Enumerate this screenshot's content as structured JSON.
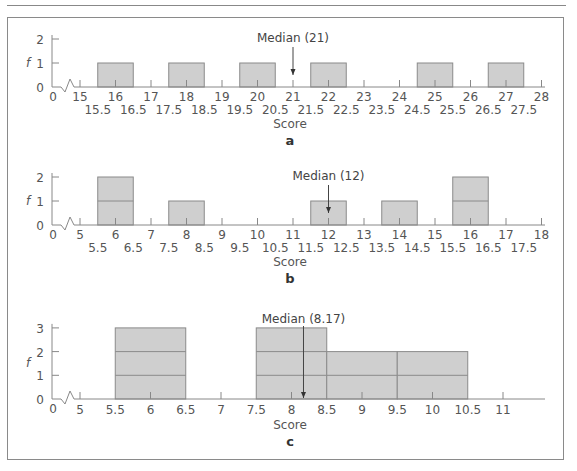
{
  "chart_data": [
    {
      "id": "a",
      "type": "bar",
      "title": "a",
      "xlabel": "Score",
      "ylabel": "f",
      "ylim": [
        0,
        2
      ],
      "yticks": [
        0,
        1,
        2
      ],
      "x_axis": {
        "origin_label": "0",
        "start": 15,
        "end": 28,
        "unit_px": 35.5,
        "origin_px": 80,
        "baseline_px": 87,
        "unit_y_px": 24
      },
      "major_ticks": [
        "15",
        "16",
        "17",
        "18",
        "19",
        "20",
        "21",
        "22",
        "23",
        "24",
        "25",
        "26",
        "27",
        "28"
      ],
      "boundary_ticks": [
        "15.5",
        "16.5",
        "17.5",
        "18.5",
        "19.5",
        "20.5",
        "21.5",
        "22.5",
        "23.5",
        "24.5",
        "25.5",
        "26.5",
        "27.5"
      ],
      "bars": [
        {
          "from": 15.5,
          "to": 16.5,
          "value": 1,
          "center": 16
        },
        {
          "from": 17.5,
          "to": 18.5,
          "value": 1,
          "center": 18
        },
        {
          "from": 19.5,
          "to": 20.5,
          "value": 1,
          "center": 20
        },
        {
          "from": 21.5,
          "to": 22.5,
          "value": 1,
          "center": 22
        },
        {
          "from": 24.5,
          "to": 25.5,
          "value": 1,
          "center": 25
        },
        {
          "from": 26.5,
          "to": 27.5,
          "value": 1,
          "center": 27
        }
      ],
      "median": {
        "label": "Median (21)",
        "value": 21
      }
    },
    {
      "id": "b",
      "type": "bar",
      "title": "b",
      "xlabel": "Score",
      "ylabel": "f",
      "ylim": [
        0,
        2
      ],
      "yticks": [
        0,
        1,
        2
      ],
      "x_axis": {
        "origin_label": "0",
        "start": 5,
        "end": 18,
        "unit_px": 35.5,
        "origin_px": 80,
        "baseline_px": 225,
        "unit_y_px": 24
      },
      "major_ticks": [
        "5",
        "6",
        "7",
        "8",
        "9",
        "10",
        "11",
        "12",
        "13",
        "14",
        "15",
        "16",
        "17",
        "18"
      ],
      "boundary_ticks": [
        "5.5",
        "6.5",
        "7.5",
        "8.5",
        "9.5",
        "10.5",
        "11.5",
        "12.5",
        "13.5",
        "14.5",
        "15.5",
        "16.5",
        "17.5"
      ],
      "bars": [
        {
          "from": 5.5,
          "to": 6.5,
          "value": 2,
          "center": 6
        },
        {
          "from": 7.5,
          "to": 8.5,
          "value": 1,
          "center": 8
        },
        {
          "from": 11.5,
          "to": 12.5,
          "value": 1,
          "center": 12
        },
        {
          "from": 13.5,
          "to": 14.5,
          "value": 1,
          "center": 14
        },
        {
          "from": 15.5,
          "to": 16.5,
          "value": 2,
          "center": 16
        }
      ],
      "median": {
        "label": "Median (12)",
        "value": 12
      }
    },
    {
      "id": "c",
      "type": "bar",
      "title": "c",
      "xlabel": "Score",
      "ylabel": "f",
      "ylim": [
        0,
        3
      ],
      "yticks": [
        0,
        1,
        2,
        3
      ],
      "x_axis": {
        "origin_label": "0",
        "start": 5,
        "end": 11,
        "unit_px": 70.5,
        "origin_px": 80,
        "baseline_px": 399,
        "unit_y_px": 23.7
      },
      "tick_labels": [
        "5",
        "5.5",
        "6",
        "6.5",
        "7",
        "7.5",
        "8",
        "8.5",
        "9",
        "9.5",
        "10",
        "10.5",
        "11"
      ],
      "bars": [
        {
          "from": 5.5,
          "to": 6.5,
          "value": 3,
          "center": 6
        },
        {
          "from": 7.5,
          "to": 8.5,
          "value": 3,
          "center": 8
        },
        {
          "from": 8.5,
          "to": 9.5,
          "value": 2,
          "center": 9
        },
        {
          "from": 9.5,
          "to": 10.5,
          "value": 2,
          "center": 10
        }
      ],
      "median": {
        "label": "Median (8.17)",
        "value": 8.17
      }
    }
  ],
  "colors": {
    "bar_fill": "#cfcfcf",
    "bar_stroke": "#8a8a8a",
    "axis": "#888888",
    "text": "#555555"
  }
}
